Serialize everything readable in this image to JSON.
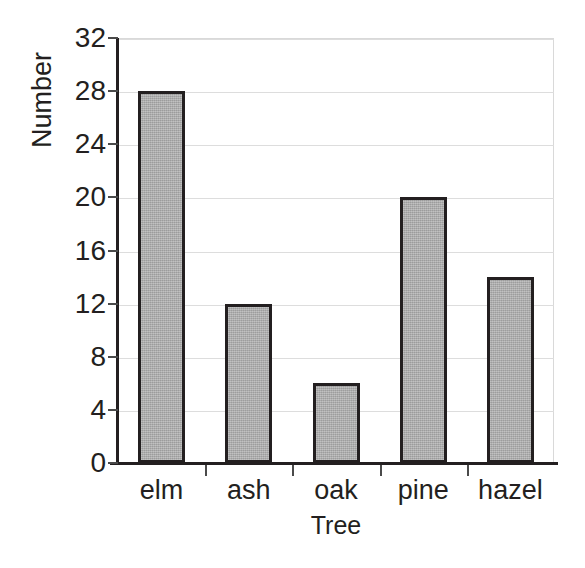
{
  "chart_data": {
    "type": "bar",
    "title": "",
    "xlabel": "Tree",
    "ylabel": "Number",
    "categories": [
      "elm",
      "ash",
      "oak",
      "pine",
      "hazel"
    ],
    "values": [
      28,
      12,
      6,
      20,
      14
    ],
    "ylim": [
      0,
      32
    ],
    "y_ticks": [
      0,
      4,
      8,
      12,
      16,
      20,
      24,
      28,
      32
    ],
    "y_tick_labels": [
      "0",
      "4",
      "8",
      "12",
      "16",
      "20",
      "24",
      "28",
      "32"
    ],
    "grid": true,
    "grid_axis": "y",
    "legend": false,
    "bar_fill_color": "#ababab",
    "bar_edge_color": "#231f20",
    "gridline_color": "#dddddd",
    "axis_color": "#231f20",
    "background_color": "#ffffff"
  }
}
